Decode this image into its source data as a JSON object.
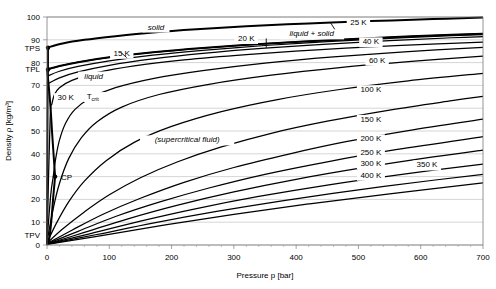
{
  "chart_data": {
    "type": "line",
    "title": "",
    "xlabel": "Pressure p [bar]",
    "ylabel": "Density ρ [kg/m³]",
    "xlim": [
      0,
      700
    ],
    "ylim": [
      0,
      100
    ],
    "grid": true,
    "legend_position": "inline-labels",
    "xticks": [
      0,
      100,
      200,
      300,
      400,
      500,
      600,
      700
    ],
    "xtick_labels": [
      "0",
      "100",
      "200",
      "300",
      "400",
      "500",
      "600",
      "700"
    ],
    "xminor_step": 20,
    "yticks": [
      0,
      10,
      20,
      30,
      40,
      50,
      60,
      70,
      80,
      90,
      100
    ],
    "ytick_labels": [
      "0",
      "10",
      "20",
      "30",
      "40",
      "50",
      "60",
      "70",
      "80",
      "90",
      "100"
    ],
    "special_yticks": [
      {
        "name": "TPS",
        "label": "TPS",
        "value": 86.5
      },
      {
        "name": "TPL",
        "label": "TPL",
        "value": 77.0
      },
      {
        "name": "TPV",
        "label": "TPV",
        "value": 4.5
      }
    ],
    "markers": [
      {
        "name": "critical-point",
        "label": "CP",
        "x": 13,
        "y": 30.0
      },
      {
        "name": "triple-point-solid",
        "label": "",
        "x": 0,
        "y": 86.5
      },
      {
        "name": "triple-point-liquid",
        "label": "",
        "x": 0,
        "y": 77.0
      }
    ],
    "region_labels": [
      {
        "name": "solid",
        "text": "solid",
        "x": 175,
        "y": 94.5
      },
      {
        "name": "liquid-plus-solid",
        "text": "liquid + solid",
        "x": 425,
        "y": 91.5
      },
      {
        "name": "liquid",
        "text": "liquid",
        "x": 75,
        "y": 73.0
      },
      {
        "name": "supercritical-fluid",
        "text": "(supercritical fluid)",
        "x": 225,
        "y": 45.0
      }
    ],
    "isotherm_labels": [
      {
        "text": "15 K",
        "x": 120,
        "y": 83.0
      },
      {
        "text": "20 K",
        "x": 320,
        "y": 89.5
      },
      {
        "text": "25 K",
        "x": 500,
        "y": 96.5
      },
      {
        "text": "30 K",
        "x": 30,
        "y": 63.5
      },
      {
        "text": "T_crit",
        "x": 85,
        "y": 64.0,
        "sub": "crit",
        "base": "T"
      },
      {
        "text": "40 K",
        "x": 520,
        "y": 88.0
      },
      {
        "text": "60 K",
        "x": 530,
        "y": 80.0
      },
      {
        "text": "100 K",
        "x": 520,
        "y": 67.0
      },
      {
        "text": "150 K",
        "x": 520,
        "y": 54.0
      },
      {
        "text": "200 K",
        "x": 520,
        "y": 45.5
      },
      {
        "text": "250 K",
        "x": 520,
        "y": 39.5
      },
      {
        "text": "300 K",
        "x": 520,
        "y": 34.5
      },
      {
        "text": "350 K",
        "x": 610,
        "y": 34.0
      },
      {
        "text": "400 K",
        "x": 520,
        "y": 29.5
      }
    ],
    "series": [
      {
        "name": "solidus-upper-boundary",
        "label": "solid melting boundary (upper)",
        "style": "boundary",
        "points": [
          [
            0,
            86.5
          ],
          [
            25,
            88.4
          ],
          [
            60,
            90.0
          ],
          [
            110,
            91.6
          ],
          [
            170,
            93.2
          ],
          [
            240,
            94.6
          ],
          [
            320,
            95.9
          ],
          [
            420,
            97.2
          ],
          [
            520,
            98.2
          ],
          [
            620,
            99.1
          ],
          [
            700,
            99.8
          ]
        ]
      },
      {
        "name": "liquidus-lower-boundary",
        "label": "melting boundary (lower)",
        "style": "boundary",
        "points": [
          [
            0,
            77.0
          ],
          [
            20,
            78.5
          ],
          [
            50,
            80.2
          ],
          [
            100,
            82.3
          ],
          [
            170,
            84.5
          ],
          [
            250,
            86.4
          ],
          [
            350,
            88.3
          ],
          [
            450,
            89.8
          ],
          [
            550,
            91.1
          ],
          [
            650,
            92.2
          ],
          [
            700,
            92.7
          ]
        ]
      },
      {
        "name": "isotherm-15K",
        "label": "15 K",
        "style": "iso",
        "points": [
          [
            0,
            77.0
          ],
          [
            20,
            78.5
          ],
          [
            50,
            80.2
          ],
          [
            100,
            82.3
          ],
          [
            170,
            84.5
          ],
          [
            250,
            86.4
          ],
          [
            350,
            88.3
          ],
          [
            450,
            89.8
          ],
          [
            550,
            91.1
          ],
          [
            650,
            92.2
          ],
          [
            700,
            92.7
          ]
        ]
      },
      {
        "name": "isotherm-20K",
        "label": "20 K",
        "style": "iso",
        "points": [
          [
            0,
            74.0
          ],
          [
            20,
            76.2
          ],
          [
            50,
            78.3
          ],
          [
            100,
            80.8
          ],
          [
            170,
            83.3
          ],
          [
            250,
            85.4
          ],
          [
            350,
            87.5
          ],
          [
            450,
            89.2
          ],
          [
            550,
            90.6
          ],
          [
            650,
            91.8
          ],
          [
            700,
            92.3
          ]
        ]
      },
      {
        "name": "isotherm-25K",
        "label": "25 K",
        "style": "iso",
        "points": [
          [
            0,
            70.5
          ],
          [
            20,
            73.3
          ],
          [
            50,
            75.9
          ],
          [
            100,
            78.8
          ],
          [
            170,
            81.6
          ],
          [
            250,
            84.0
          ],
          [
            350,
            86.3
          ],
          [
            450,
            88.1
          ],
          [
            550,
            89.6
          ],
          [
            650,
            90.9
          ],
          [
            700,
            91.4
          ]
        ]
      },
      {
        "name": "isotherm-30K",
        "label": "30 K",
        "style": "iso",
        "points": [
          [
            0,
            2.2
          ],
          [
            5,
            55.0
          ],
          [
            8,
            62.0
          ],
          [
            12,
            66.0
          ],
          [
            20,
            69.0
          ],
          [
            40,
            72.2
          ],
          [
            80,
            75.6
          ],
          [
            140,
            78.6
          ],
          [
            220,
            81.2
          ],
          [
            320,
            83.5
          ],
          [
            440,
            85.7
          ],
          [
            560,
            87.4
          ],
          [
            700,
            89.0
          ]
        ]
      },
      {
        "name": "isotherm-Tcrit",
        "label": "T_crit",
        "style": "iso",
        "points": [
          [
            0,
            1.8
          ],
          [
            6,
            22.0
          ],
          [
            10,
            30.0
          ],
          [
            14,
            38.0
          ],
          [
            20,
            46.0
          ],
          [
            30,
            53.5
          ],
          [
            45,
            59.5
          ],
          [
            70,
            64.5
          ],
          [
            110,
            69.0
          ],
          [
            170,
            73.0
          ],
          [
            250,
            76.5
          ],
          [
            350,
            79.8
          ],
          [
            460,
            82.5
          ],
          [
            580,
            84.8
          ],
          [
            700,
            86.7
          ]
        ]
      },
      {
        "name": "isotherm-40K",
        "label": "40 K",
        "style": "iso",
        "points": [
          [
            0,
            1.4
          ],
          [
            10,
            16.0
          ],
          [
            20,
            27.0
          ],
          [
            35,
            38.0
          ],
          [
            55,
            47.0
          ],
          [
            80,
            54.0
          ],
          [
            120,
            60.5
          ],
          [
            180,
            66.0
          ],
          [
            260,
            70.5
          ],
          [
            360,
            74.5
          ],
          [
            470,
            77.8
          ],
          [
            590,
            80.6
          ],
          [
            700,
            82.8
          ]
        ]
      },
      {
        "name": "isotherm-60K",
        "label": "60 K",
        "style": "iso",
        "points": [
          [
            0,
            1.0
          ],
          [
            15,
            9.5
          ],
          [
            35,
            19.0
          ],
          [
            60,
            28.0
          ],
          [
            95,
            37.0
          ],
          [
            140,
            45.0
          ],
          [
            200,
            52.0
          ],
          [
            280,
            58.5
          ],
          [
            370,
            63.8
          ],
          [
            470,
            68.2
          ],
          [
            580,
            72.0
          ],
          [
            700,
            75.3
          ]
        ]
      },
      {
        "name": "isotherm-100K",
        "label": "100 K",
        "style": "iso",
        "points": [
          [
            0,
            0.8
          ],
          [
            25,
            7.0
          ],
          [
            60,
            14.5
          ],
          [
            100,
            22.0
          ],
          [
            150,
            29.5
          ],
          [
            210,
            36.5
          ],
          [
            280,
            43.0
          ],
          [
            360,
            49.0
          ],
          [
            450,
            54.3
          ],
          [
            550,
            59.2
          ],
          [
            650,
            63.3
          ],
          [
            700,
            65.2
          ]
        ]
      },
      {
        "name": "isotherm-150K",
        "label": "150 K",
        "style": "iso",
        "points": [
          [
            0,
            0.6
          ],
          [
            40,
            6.5
          ],
          [
            90,
            13.5
          ],
          [
            150,
            20.5
          ],
          [
            220,
            27.5
          ],
          [
            300,
            34.0
          ],
          [
            390,
            40.0
          ],
          [
            480,
            45.3
          ],
          [
            580,
            50.2
          ],
          [
            700,
            55.2
          ]
        ]
      },
      {
        "name": "isotherm-200K",
        "label": "200 K",
        "style": "iso",
        "points": [
          [
            0,
            0.5
          ],
          [
            50,
            6.0
          ],
          [
            110,
            12.5
          ],
          [
            180,
            18.8
          ],
          [
            260,
            25.0
          ],
          [
            350,
            31.0
          ],
          [
            450,
            36.5
          ],
          [
            560,
            41.8
          ],
          [
            700,
            47.5
          ]
        ]
      },
      {
        "name": "isotherm-250K",
        "label": "250 K",
        "style": "iso",
        "points": [
          [
            0,
            0.4
          ],
          [
            60,
            5.5
          ],
          [
            130,
            11.5
          ],
          [
            210,
            17.5
          ],
          [
            300,
            23.3
          ],
          [
            400,
            28.8
          ],
          [
            510,
            34.0
          ],
          [
            620,
            38.6
          ],
          [
            700,
            41.6
          ]
        ]
      },
      {
        "name": "isotherm-300K",
        "label": "300 K",
        "style": "iso",
        "points": [
          [
            0,
            0.35
          ],
          [
            70,
            5.0
          ],
          [
            150,
            10.5
          ],
          [
            240,
            16.0
          ],
          [
            340,
            21.3
          ],
          [
            450,
            26.3
          ],
          [
            570,
            31.0
          ],
          [
            700,
            35.5
          ]
        ]
      },
      {
        "name": "isotherm-350K",
        "label": "350 K",
        "style": "iso",
        "points": [
          [
            0,
            0.3
          ],
          [
            80,
            4.6
          ],
          [
            170,
            9.6
          ],
          [
            270,
            14.6
          ],
          [
            380,
            19.5
          ],
          [
            500,
            24.2
          ],
          [
            620,
            28.4
          ],
          [
            700,
            31.0
          ]
        ]
      },
      {
        "name": "isotherm-400K",
        "label": "400 K",
        "style": "iso",
        "points": [
          [
            0,
            0.25
          ],
          [
            90,
            4.2
          ],
          [
            190,
            8.8
          ],
          [
            300,
            13.4
          ],
          [
            420,
            18.0
          ],
          [
            550,
            22.4
          ],
          [
            700,
            27.2
          ]
        ]
      },
      {
        "name": "saturation-vapor-line",
        "label": "vapor saturation",
        "style": "boundary",
        "points": [
          [
            0,
            0.0
          ],
          [
            2,
            1.2
          ],
          [
            4,
            3.5
          ],
          [
            6,
            8.0
          ],
          [
            8,
            14.0
          ],
          [
            10,
            21.0
          ],
          [
            12,
            27.0
          ],
          [
            13,
            30.0
          ]
        ]
      },
      {
        "name": "saturation-liquid-line",
        "label": "liquid saturation",
        "style": "boundary",
        "points": [
          [
            0,
            77.0
          ],
          [
            2,
            72.0
          ],
          [
            4,
            66.0
          ],
          [
            6,
            59.0
          ],
          [
            8,
            50.0
          ],
          [
            10,
            42.0
          ],
          [
            12,
            34.0
          ],
          [
            13,
            30.0
          ]
        ]
      },
      {
        "name": "sublimation-vertical-line",
        "label": "sublimation/left wall",
        "style": "boundary",
        "points": [
          [
            0,
            0.0
          ],
          [
            0.5,
            40.0
          ],
          [
            1,
            70.0
          ],
          [
            1.5,
            77.0
          ],
          [
            1.5,
            86.5
          ]
        ]
      }
    ]
  }
}
